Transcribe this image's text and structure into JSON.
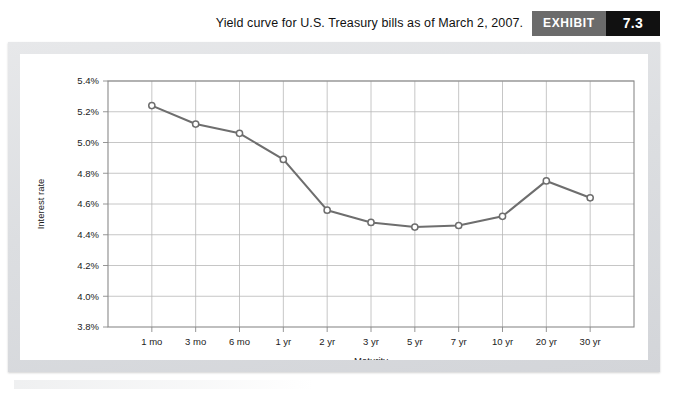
{
  "header": {
    "title": "Yield curve for U.S. Treasury bills as of March 2, 2007.",
    "exhibit_word": "EXHIBIT",
    "exhibit_number": "7.3"
  },
  "colors": {
    "exhibit_word_bg": "#6b6b6b",
    "exhibit_num_bg": "#111111",
    "frame": "#dcdee1",
    "card": "#ffffff",
    "line": "#6e6e6e",
    "grid": "#b8b8b8",
    "axis": "#8a8a8a",
    "marker_fill": "#ffffff"
  },
  "chart_data": {
    "type": "line",
    "title": "Yield curve for U.S. Treasury bills as of March 2, 2007.",
    "xlabel": "Maturity",
    "ylabel": "Interest rate",
    "categories": [
      "1 mo",
      "3 mo",
      "6 mo",
      "1 yr",
      "2 yr",
      "3 yr",
      "5 yr",
      "7 yr",
      "10 yr",
      "20 yr",
      "30 yr"
    ],
    "values": [
      5.24,
      5.12,
      5.06,
      4.89,
      4.56,
      4.48,
      4.45,
      4.46,
      4.52,
      4.75,
      4.64
    ],
    "ylim": [
      3.8,
      5.4
    ],
    "ytick_step": 0.2,
    "ytick_labels": [
      "5.4%",
      "5.2%",
      "5.0%",
      "4.8%",
      "4.6%",
      "4.4%",
      "4.2%",
      "4.0%",
      "3.8%"
    ],
    "ytick_values": [
      5.4,
      5.2,
      5.0,
      4.8,
      4.6,
      4.4,
      4.2,
      4.0,
      3.8
    ],
    "grid": true,
    "legend": "none",
    "marker": "open-circle",
    "series_name": "Yield"
  }
}
